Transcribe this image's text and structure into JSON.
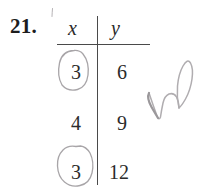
{
  "worksheet": {
    "problem_number": "21.",
    "table": {
      "headers": [
        "x",
        "y"
      ],
      "rows": [
        {
          "x": "3",
          "y": "6"
        },
        {
          "x": "4",
          "y": "9"
        },
        {
          "x": "3",
          "y": "12"
        }
      ]
    },
    "annotations": {
      "handwritten_note": "no",
      "circled_values": [
        "3",
        "3"
      ],
      "tick_mark": "'"
    },
    "colors": {
      "ink": "#2b2b2b",
      "rule": "#4a4a4a",
      "pencil": "#a8a5a8",
      "background": "#ffffff"
    }
  }
}
